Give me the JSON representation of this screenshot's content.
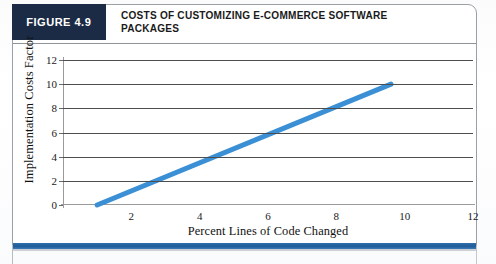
{
  "figure": {
    "tag": "FIGURE 4.9",
    "title_line1": "COSTS OF CUSTOMIZING E-COMMERCE SOFTWARE",
    "title_line2": "PACKAGES",
    "tag_background": "#1c2b45",
    "rule_color": "#2f6fae"
  },
  "chart_data": {
    "type": "line",
    "title": "COSTS OF CUSTOMIZING E-COMMERCE SOFTWARE PACKAGES",
    "xlabel": "Percent Lines of Code Changed",
    "ylabel": "Implementation Costs Factor",
    "xlim": [
      0,
      12
    ],
    "ylim": [
      0,
      12
    ],
    "xticks": [
      2,
      4,
      6,
      8,
      10,
      12
    ],
    "yticks": [
      0,
      2,
      4,
      6,
      8,
      10,
      12
    ],
    "xticklabels": [
      "2",
      "4",
      "6",
      "8",
      "10",
      "12"
    ],
    "yticklabels": [
      "0",
      "2",
      "4",
      "6",
      "8",
      "10",
      "12"
    ],
    "grid": "horizontal",
    "legend": "none",
    "series": [
      {
        "name": "Implementation cost factor",
        "color": "#3b8fd4",
        "linewidth": 5,
        "x": [
          1.0,
          9.6
        ],
        "values": [
          0.0,
          10.0
        ]
      }
    ]
  }
}
